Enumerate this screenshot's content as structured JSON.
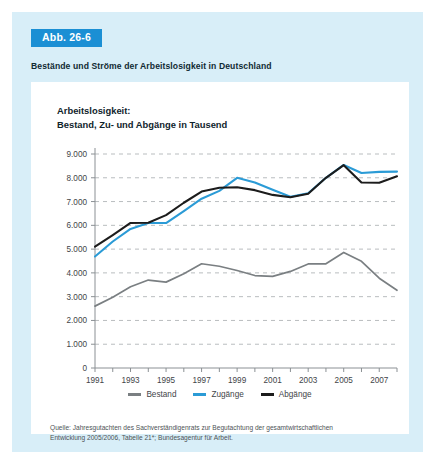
{
  "figure": {
    "badge": "Abb. 26-6",
    "subtitle": "Bestände und Ströme der Arbeitslosigkeit in Deutschland",
    "source_line_1": "Quelle: Jahresgutachten des Sachverständigenrats zur Begutachtung der gesamtwirtschaftlichen",
    "source_line_2": "Entwicklung 2005/2006, Tabelle 21*; Bundesagentur für Arbeit."
  },
  "colors": {
    "badge_bg": "#1b8fd4",
    "card_bg": "#d8eef8",
    "panel_bg": "#ffffff",
    "bestand": "#7a7f82",
    "zugaenge": "#2b9bd6",
    "abgaenge": "#1c1c1c",
    "grid": "#b9bdbf",
    "axis": "#8b9094"
  },
  "chart_data": {
    "type": "line",
    "title": "Arbeitslosigkeit:",
    "title_line_2": "Bestand, Zu- und Abgänge in Tausend",
    "xlabel": "",
    "ylabel": "",
    "ylim": [
      0,
      9000
    ],
    "ytick_labels": [
      "9.000",
      "8.000",
      "7.000",
      "6.000",
      "5.000",
      "4.000",
      "3.000",
      "2.000",
      "1.000",
      "0"
    ],
    "ytick_values": [
      9000,
      8000,
      7000,
      6000,
      5000,
      4000,
      3000,
      2000,
      1000,
      0
    ],
    "grid": true,
    "legend_position": "bottom",
    "x": [
      1991,
      1992,
      1993,
      1994,
      1995,
      1996,
      1997,
      1998,
      1999,
      2000,
      2001,
      2002,
      2003,
      2004,
      2005,
      2006,
      2007,
      2008
    ],
    "xtick_labels": [
      "1991",
      "1993",
      "1995",
      "1997",
      "1999",
      "2001",
      "2003",
      "2005",
      "2007"
    ],
    "xtick_values": [
      1991,
      1993,
      1995,
      1997,
      1999,
      2001,
      2003,
      2005,
      2007
    ],
    "series": [
      {
        "name": "Bestand",
        "color": "#7a7f82",
        "values": [
          2602,
          2979,
          3419,
          3698,
          3612,
          3965,
          4384,
          4279,
          4100,
          3889,
          3853,
          4061,
          4377,
          4381,
          4861,
          4487,
          3777,
          3268
        ]
      },
      {
        "name": "Zugänge",
        "color": "#2b9bd6",
        "values": [
          4690,
          5320,
          5850,
          6095,
          6095,
          6600,
          7120,
          7450,
          8000,
          7800,
          7500,
          7200,
          7350,
          8000,
          8540,
          8200,
          8250,
          8260
        ]
      },
      {
        "name": "Abgänge",
        "color": "#1c1c1c",
        "values": [
          5100,
          5590,
          6100,
          6110,
          6430,
          6950,
          7420,
          7580,
          7600,
          7480,
          7280,
          7180,
          7330,
          8000,
          8530,
          7800,
          7790,
          8060
        ]
      }
    ]
  }
}
